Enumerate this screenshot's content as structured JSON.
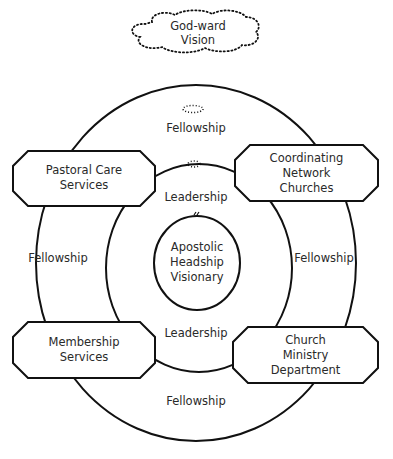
{
  "diagram": {
    "top": {
      "cloud_label": "God-ward\nVision"
    },
    "rings": {
      "outer_labels": {
        "top": "Fellowship",
        "left": "Fellowship",
        "right": "Fellowship",
        "bottom": "Fellowship"
      },
      "inner_labels": {
        "top": "Leadership",
        "bottom": "Leadership"
      },
      "center": "Apostolic\nHeadship\nVisionary"
    },
    "boxes": [
      {
        "id": "pastoral",
        "label": "Pastoral Care\nServices"
      },
      {
        "id": "coordinating",
        "label": "Coordinating\nNetwork\nChurches"
      },
      {
        "id": "membership",
        "label": "Membership\nServices"
      },
      {
        "id": "church",
        "label": "Church\nMinistry\nDepartment"
      }
    ],
    "colors": {
      "stroke": "#111111",
      "text": "#2a2a2a",
      "background": "#ffffff"
    }
  }
}
